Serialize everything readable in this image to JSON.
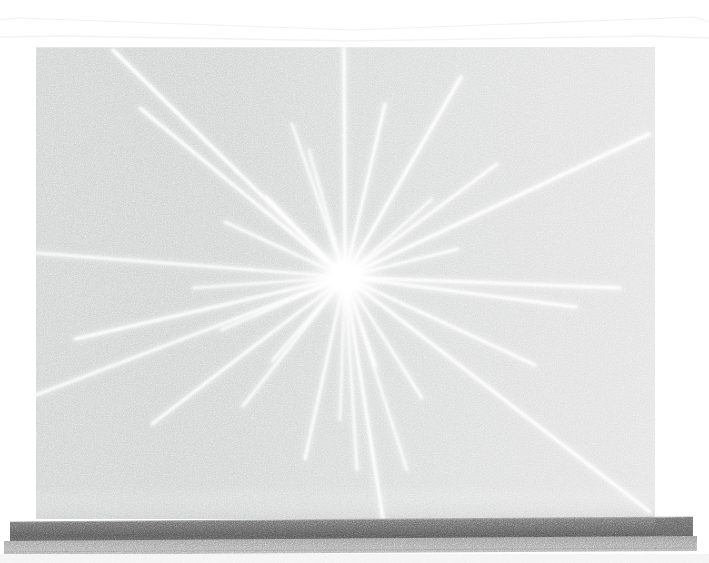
{
  "scene": {
    "kind": "photograph",
    "subject": "gallery-wall-drawing",
    "title": "Radiating white lines converging on a single point, drawn on a gray gallery wall",
    "width": 709,
    "height": 563
  },
  "colors": {
    "background": "#ffffff",
    "ceiling": "#fdfdfd",
    "cornice_line": "#e9e9e9",
    "wall_left": "#cfd0d0",
    "wall_mid": "#d8d9d9",
    "wall_right": "#e2e2e2",
    "wall_panel_seam": "#dcdcdc",
    "line_white": "#ffffff",
    "glow": "#ffffff",
    "baseboard_dark": "#6b6b6b",
    "baseboard_darker": "#555555",
    "floor_strip": "#a0a0a0",
    "floor_light": "#f2f2f2",
    "wall_shadow_bottom": "#c6c7c7"
  },
  "geometry": {
    "wall": {
      "left": 36,
      "top": 47,
      "right": 655,
      "bottom": 519,
      "note": "flat rectangular gallery wall, slight vignette darker at left"
    },
    "ceiling_cornice": {
      "top_y": 18,
      "apex_left_x": 18,
      "apex_right_x": 695,
      "meet_y": 36,
      "note": "thin white soffit band above wall, faint V-shaped shadow line"
    },
    "panel_seam_x": 430,
    "baseboard": {
      "top": 519,
      "bottom": 537,
      "left": 10,
      "right": 693
    },
    "floor": {
      "top": 537,
      "bottom": 551
    },
    "burst_center": {
      "x": 345,
      "y": 277
    },
    "glow_radius": 46
  },
  "chart_data": {
    "type": "scatter",
    "center": {
      "x": 345,
      "y": 277
    },
    "xlabel": "x (px)",
    "ylabel": "y (px)",
    "xlim": [
      36,
      655
    ],
    "ylim": [
      47,
      519
    ],
    "grid": false,
    "legend": "none",
    "rays": [
      {
        "id": 1,
        "x": 113,
        "y": 50,
        "width": 3.2,
        "note": "long ray to upper-left, ends near wall top-left"
      },
      {
        "id": 2,
        "x": 140,
        "y": 108,
        "width": 3.0,
        "note": "upper-left ray, second from top"
      },
      {
        "id": 3,
        "x": 225,
        "y": 222,
        "width": 2.4,
        "note": "short upper-left ray"
      },
      {
        "id": 4,
        "x": 36,
        "y": 253,
        "width": 2.6,
        "note": "ray exits left wall edge, nearly horizontal"
      },
      {
        "id": 5,
        "x": 193,
        "y": 288,
        "width": 2.2,
        "note": "short ray, left and slightly below center"
      },
      {
        "id": 6,
        "x": 36,
        "y": 395,
        "width": 2.6,
        "note": "long lower-left ray to left wall edge"
      },
      {
        "id": 7,
        "x": 75,
        "y": 339,
        "width": 3.0,
        "note": "lower-left ray, shallow angle"
      },
      {
        "id": 8,
        "x": 152,
        "y": 424,
        "width": 2.8,
        "note": "lower-left diagonal ray"
      },
      {
        "id": 9,
        "x": 243,
        "y": 406,
        "width": 2.4,
        "note": "short lower-left ray"
      },
      {
        "id": 10,
        "x": 305,
        "y": 459,
        "width": 2.6,
        "note": "lower-left steep ray"
      },
      {
        "id": 11,
        "x": 344,
        "y": 48,
        "width": 3.0,
        "note": "near-vertical ray to top of wall"
      },
      {
        "id": 12,
        "x": 309,
        "y": 150,
        "width": 2.0,
        "note": "short ray straight up, slightly left"
      },
      {
        "id": 13,
        "x": 385,
        "y": 104,
        "width": 2.8,
        "note": "upper-right ray, steep"
      },
      {
        "id": 14,
        "x": 461,
        "y": 77,
        "width": 3.2,
        "note": "long upper-right ray to near wall top"
      },
      {
        "id": 15,
        "x": 497,
        "y": 164,
        "width": 2.8,
        "note": "upper-right diagonal ray"
      },
      {
        "id": 16,
        "x": 649,
        "y": 134,
        "width": 3.2,
        "note": "longest upper-right ray, reaches right wall edge"
      },
      {
        "id": 17,
        "x": 458,
        "y": 249,
        "width": 2.4,
        "note": "short right ray, slightly above horizontal"
      },
      {
        "id": 18,
        "x": 620,
        "y": 288,
        "width": 3.0,
        "note": "long right ray, just below horizontal"
      },
      {
        "id": 19,
        "x": 576,
        "y": 307,
        "width": 2.8,
        "note": "right ray, shallow downward"
      },
      {
        "id": 20,
        "x": 535,
        "y": 365,
        "width": 2.8,
        "note": "lower-right diagonal ray"
      },
      {
        "id": 21,
        "x": 650,
        "y": 512,
        "width": 3.0,
        "note": "long lower-right ray to bottom-right corner"
      },
      {
        "id": 22,
        "x": 422,
        "y": 398,
        "width": 2.4,
        "note": "short lower-right ray"
      },
      {
        "id": 23,
        "x": 376,
        "y": 366,
        "width": 2.0,
        "note": "very short ray below center"
      },
      {
        "id": 24,
        "x": 383,
        "y": 519,
        "width": 3.0,
        "note": "near-vertical ray down to baseboard"
      },
      {
        "id": 25,
        "x": 357,
        "y": 470,
        "width": 2.2,
        "note": "short near-vertical ray downward"
      },
      {
        "id": 26,
        "x": 340,
        "y": 420,
        "width": 2.0,
        "note": "short vertical ray straight down"
      },
      {
        "id": 27,
        "x": 407,
        "y": 470,
        "width": 2.2,
        "note": "short lower-right steep ray"
      },
      {
        "id": 28,
        "x": 266,
        "y": 196,
        "width": 2.0,
        "note": "short upper-left ray near center"
      },
      {
        "id": 29,
        "x": 292,
        "y": 124,
        "width": 2.2,
        "note": "short upper ray, slightly left of vertical"
      },
      {
        "id": 30,
        "x": 432,
        "y": 199,
        "width": 2.2,
        "note": "short upper-right ray near center"
      },
      {
        "id": 31,
        "x": 221,
        "y": 330,
        "width": 2.0,
        "note": "short lower-left ray near center"
      },
      {
        "id": 32,
        "x": 272,
        "y": 361,
        "width": 2.0,
        "note": "short lower-left ray near center"
      }
    ]
  },
  "labels": {
    "wall": "gallery-wall",
    "burst": "radial-line-burst",
    "baseboard": "baseboard",
    "floor": "floor",
    "ceiling": "ceiling-soffit"
  }
}
